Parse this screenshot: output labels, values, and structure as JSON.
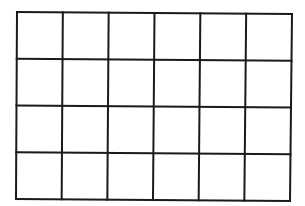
{
  "grid": {
    "columns": 6,
    "rows": 4,
    "line_color": "#1a1a1a",
    "background": "#ffffff",
    "line_width": 2,
    "corners": {
      "top_left": [
        17,
        12
      ],
      "top_right": [
        292,
        14
      ],
      "bottom_left": [
        16,
        199
      ],
      "bottom_right": [
        290,
        201
      ]
    }
  }
}
